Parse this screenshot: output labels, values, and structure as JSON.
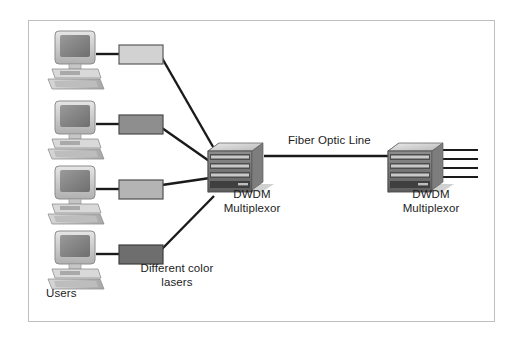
{
  "diagram": {
    "background_color": "#ffffff",
    "frame_border_color": "#bfbfbf",
    "line_color": "#1a1a1a",
    "labels": {
      "users": "Users",
      "lasers": "Different color lasers",
      "fiber": "Fiber Optic Line",
      "mux_left": "DWDM Multiplexor",
      "mux_right": "DWDM Multiplexor"
    },
    "workstations": [
      {
        "id": "workstation-1",
        "x": 52,
        "y": 32,
        "icon": "desktop-computer-icon"
      },
      {
        "id": "workstation-2",
        "x": 52,
        "y": 102,
        "icon": "desktop-computer-icon"
      },
      {
        "id": "workstation-3",
        "x": 52,
        "y": 167,
        "icon": "desktop-computer-icon"
      },
      {
        "id": "workstation-4",
        "x": 52,
        "y": 232,
        "icon": "desktop-computer-icon"
      }
    ],
    "lasers": [
      {
        "id": "laser-1",
        "x": 118,
        "y": 45,
        "w": 44,
        "h": 19,
        "color": "#d2d2d2",
        "icon": "laser-transmitter-icon"
      },
      {
        "id": "laser-2",
        "x": 118,
        "y": 115,
        "w": 44,
        "h": 19,
        "color": "#8e8e8e",
        "icon": "laser-transmitter-icon"
      },
      {
        "id": "laser-3",
        "x": 118,
        "y": 180,
        "w": 44,
        "h": 19,
        "color": "#b4b4b4",
        "icon": "laser-transmitter-icon"
      },
      {
        "id": "laser-4",
        "x": 118,
        "y": 245,
        "w": 44,
        "h": 19,
        "color": "#6e6e6e",
        "icon": "laser-transmitter-icon"
      }
    ],
    "multiplexors": [
      {
        "id": "dwdm-multiplexor-left",
        "x": 206,
        "y": 143,
        "rack_rows": 4,
        "icon": "rack-chassis-icon"
      },
      {
        "id": "dwdm-multiplexor-right",
        "x": 386,
        "y": 143,
        "rack_rows": 4,
        "icon": "rack-chassis-icon"
      }
    ],
    "fiber_outputs": 4
  }
}
